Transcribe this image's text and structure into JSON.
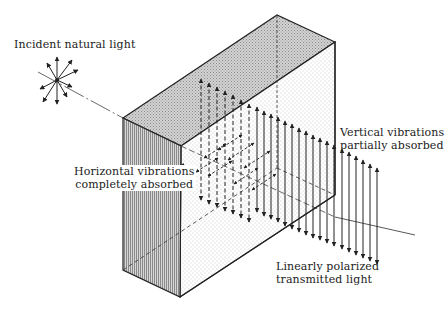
{
  "diagram": {
    "labels": {
      "incident": "Incident natural light",
      "horizontal_line1": "Horizontal vibrations",
      "horizontal_line2": "completely absorbed",
      "vertical_line1": "Vertical vibrations",
      "vertical_line2": "partially absorbed",
      "transmitted_line1": "Linearly polarized",
      "transmitted_line2": "transmitted light"
    },
    "colors": {
      "ink": "#222222",
      "top_face": "#c8c8c8",
      "front_face": "#bdbdbd",
      "side_face": "#f4f4f4"
    },
    "geometry": {
      "starburst_center": [
        57,
        80
      ],
      "starburst_radius": 20,
      "box": {
        "front_left_top": [
          123,
          118
        ],
        "front_right_top": [
          181,
          146
        ],
        "back_left_top": [
          277,
          15
        ],
        "back_right_top": [
          335,
          42
        ],
        "front_left_bottom": [
          123,
          270
        ],
        "front_right_bottom": [
          180,
          297
        ],
        "back_right_bottom": [
          335,
          195
        ]
      },
      "axis_start": [
        38,
        72
      ],
      "axis_end": [
        415,
        235
      ]
    }
  }
}
